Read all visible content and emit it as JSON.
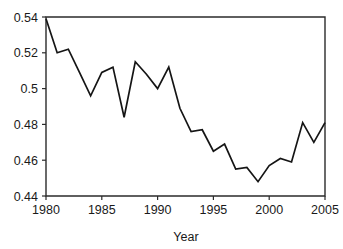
{
  "chart_data": {
    "type": "line",
    "title": "",
    "subtitle": "",
    "xlabel": "Year",
    "ylabel": "",
    "xlim": [
      1980,
      2005
    ],
    "ylim": [
      0.44,
      0.54
    ],
    "grid": false,
    "legend": null,
    "x_ticks": [
      "1980",
      "1985",
      "1990",
      "1995",
      "2000",
      "2005"
    ],
    "x_tick_values": [
      1980,
      1985,
      1990,
      1995,
      2000,
      2005
    ],
    "y_ticks": [
      "0.44",
      "0.46",
      "0.48",
      "0.5",
      "0.52",
      "0.54"
    ],
    "y_tick_values": [
      0.44,
      0.46,
      0.48,
      0.5,
      0.52,
      0.54
    ],
    "line_color": "#151515",
    "axis_color": "#2b2b2b",
    "background": "#ffffff",
    "x": [
      1980,
      1981,
      1982,
      1983,
      1984,
      1985,
      1986,
      1987,
      1988,
      1989,
      1990,
      1991,
      1992,
      1993,
      1994,
      1995,
      1996,
      1997,
      1998,
      1999,
      2000,
      2001,
      2002,
      2003,
      2004,
      2005
    ],
    "values": [
      0.539,
      0.52,
      0.522,
      0.509,
      0.496,
      0.509,
      0.512,
      0.484,
      0.515,
      0.508,
      0.5,
      0.512,
      0.489,
      0.476,
      0.477,
      0.465,
      0.469,
      0.455,
      0.456,
      0.448,
      0.457,
      0.461,
      0.459,
      0.481,
      0.47,
      0.481
    ],
    "series": [
      {
        "name": "series-1",
        "values": [
          0.539,
          0.52,
          0.522,
          0.509,
          0.496,
          0.509,
          0.512,
          0.484,
          0.515,
          0.508,
          0.5,
          0.512,
          0.489,
          0.476,
          0.477,
          0.465,
          0.469,
          0.455,
          0.456,
          0.448,
          0.457,
          0.461,
          0.459,
          0.481,
          0.47,
          0.481
        ]
      }
    ]
  },
  "plot_geometry": {
    "left": 46,
    "right": 325,
    "top": 17,
    "bottom": 196
  }
}
